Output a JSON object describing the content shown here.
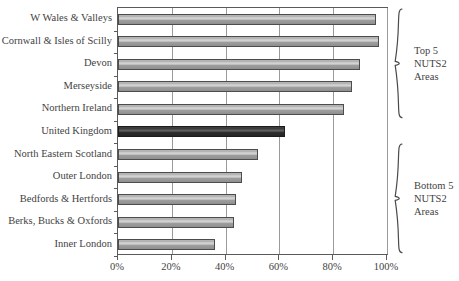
{
  "chart_data": {
    "type": "bar",
    "orientation": "horizontal",
    "title": "",
    "subtitle": "",
    "xlabel": "",
    "ylabel": "",
    "xlim": [
      0,
      100
    ],
    "xunit": "%",
    "grid": true,
    "legend": "none",
    "categories": [
      "W Wales & Valleys",
      "Cornwall & Isles of Scilly",
      "Devon",
      "Merseyside",
      "Northern Ireland",
      "United Kingdom",
      "North Eastern Scotland",
      "Outer London",
      "Bedfords & Hertfords",
      "Berks, Bucks & Oxfords",
      "Inner London"
    ],
    "values": [
      96,
      97,
      90,
      87,
      84,
      62,
      52,
      46,
      44,
      43,
      36
    ],
    "highlight_index": 5,
    "tick_labels": [
      "0%",
      "20%",
      "40%",
      "60%",
      "80%",
      "100%"
    ],
    "tick_values": [
      0,
      20,
      40,
      60,
      80,
      100
    ],
    "colors": {
      "bar": "#b4b4b4",
      "bar_highlight": "#3c3c3c",
      "bar_border": "#4c4c4c",
      "gridline": "#9a9a9a",
      "axis": "#5a5a5a",
      "text": "#3f3f3f",
      "background": "#ffffff"
    },
    "annotations": [
      {
        "id": "top-group",
        "lines": [
          "Top 5",
          "NUTS2",
          "Areas"
        ],
        "covers_indices": [
          0,
          1,
          2,
          3,
          4
        ]
      },
      {
        "id": "bottom-group",
        "lines": [
          "Bottom 5",
          "NUTS2",
          "Areas"
        ],
        "covers_indices": [
          6,
          7,
          8,
          9,
          10
        ]
      }
    ]
  }
}
